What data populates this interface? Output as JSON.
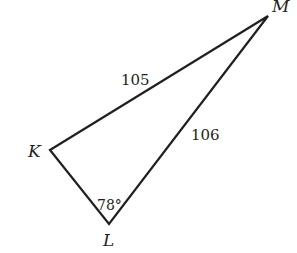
{
  "diagram": {
    "type": "triangle",
    "stroke_color": "#231f20",
    "vertices": [
      {
        "name": "M",
        "x": 268,
        "y": 16,
        "label_x": 272,
        "label_y": 12
      },
      {
        "name": "K",
        "x": 50,
        "y": 150,
        "label_x": 28,
        "label_y": 157
      },
      {
        "name": "L",
        "x": 109,
        "y": 224,
        "label_x": 103,
        "label_y": 246
      }
    ],
    "sides": [
      {
        "from": "K",
        "to": "M",
        "length": "105",
        "label_x": 121,
        "label_y": 85
      },
      {
        "from": "L",
        "to": "M",
        "length": "106",
        "label_x": 191,
        "label_y": 140
      }
    ],
    "angles": [
      {
        "vertex": "L",
        "value": "78°",
        "label_x": 97,
        "label_y": 210
      }
    ]
  }
}
